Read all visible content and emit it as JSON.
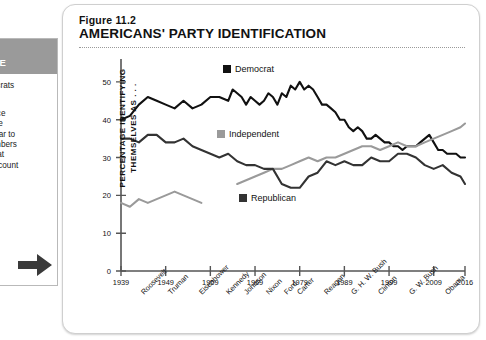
{
  "sidebar": {
    "header_lines": [
      "G",
      "NCE"
    ],
    "paragraphs": [
      "mocrats\nd",
      "Since\ns the\nppear to\nnumbers\nWhat\nt account\nsan\non?"
    ],
    "arrow_icon": "right-arrow-icon"
  },
  "figure": {
    "number": "Figure 11.2",
    "title": "AMERICANS' PARTY IDENTIFICATION"
  },
  "chart_data": {
    "type": "line",
    "title": "AMERICANS' PARTY IDENTIFICATION",
    "xlabel": "",
    "ylabel": "PERCENTAGE IDENTIFYING THEMSELVES AS . . .",
    "ylim": [
      0,
      55
    ],
    "yticks": [
      0,
      10,
      20,
      30,
      40,
      50
    ],
    "xlim": [
      1939,
      2016
    ],
    "xticks": [
      1939,
      1949,
      1959,
      1969,
      1979,
      1989,
      1999,
      2009,
      2016
    ],
    "xtick_labels": [
      "1939",
      "1949",
      "1959",
      "1969",
      "1979",
      "1989",
      "1999",
      "2009",
      "2016"
    ],
    "grid": false,
    "legend_position": "inline-annotations",
    "presidents": [
      "Roosevelt",
      "Truman",
      "Eisenhower",
      "Kennedy",
      "Johnson",
      "Nixon",
      "Ford",
      "Carter",
      "Reagan",
      "G. H. W. Bush",
      "Clinton",
      "G. W. Bush",
      "Obama"
    ],
    "president_positions": [
      1943,
      1949,
      1956,
      1962,
      1966,
      1971,
      1975,
      1978,
      1984,
      1990,
      1996,
      2003,
      2011
    ],
    "series": [
      {
        "name": "Democrat",
        "color": "#111111",
        "marker": "black-square",
        "x": [
          1939,
          1941,
          1943,
          1945,
          1947,
          1949,
          1951,
          1953,
          1955,
          1957,
          1959,
          1961,
          1963,
          1964,
          1965,
          1966,
          1967,
          1968,
          1969,
          1970,
          1971,
          1972,
          1973,
          1974,
          1975,
          1976,
          1977,
          1978,
          1979,
          1980,
          1981,
          1982,
          1983,
          1984,
          1985,
          1986,
          1987,
          1988,
          1989,
          1990,
          1991,
          1992,
          1993,
          1994,
          1995,
          1996,
          1997,
          1998,
          1999,
          2000,
          2001,
          2002,
          2003,
          2004,
          2005,
          2006,
          2007,
          2008,
          2009,
          2010,
          2011,
          2012,
          2013,
          2014,
          2015,
          2016
        ],
        "values": [
          40,
          41,
          44,
          46,
          45,
          44,
          43,
          45,
          43,
          44,
          46,
          46,
          45,
          48,
          47,
          46,
          44,
          46,
          45,
          44,
          45,
          47,
          46,
          44,
          47,
          46,
          49,
          48,
          50,
          48,
          49,
          48,
          46,
          44,
          44,
          43,
          42,
          40,
          40,
          38,
          37,
          38,
          37,
          35,
          35,
          36,
          35,
          34,
          34,
          33,
          33,
          32,
          33,
          33,
          33,
          34,
          35,
          36,
          34,
          32,
          32,
          31,
          31,
          31,
          30,
          30
        ]
      },
      {
        "name": "Independent",
        "color": "#9a9a9a",
        "marker": "gray-square",
        "x": [
          1939,
          1941,
          1943,
          1945,
          1947,
          1949,
          1951,
          1953,
          1955,
          1957,
          1965,
          1967,
          1969,
          1971,
          1973,
          1975,
          1977,
          1979,
          1981,
          1983,
          1985,
          1987,
          1989,
          1991,
          1993,
          1995,
          1997,
          1999,
          2001,
          2003,
          2005,
          2007,
          2009,
          2011,
          2013,
          2015,
          2016
        ],
        "values": [
          18,
          17,
          19,
          18,
          19,
          20,
          21,
          20,
          19,
          18,
          23,
          24,
          25,
          26,
          27,
          27,
          28,
          29,
          30,
          29,
          30,
          30,
          31,
          32,
          33,
          33,
          32,
          33,
          34,
          33,
          33,
          34,
          35,
          36,
          37,
          38,
          39
        ]
      },
      {
        "name": "Republican",
        "color": "#333333",
        "marker": "dark-square",
        "x": [
          1939,
          1941,
          1943,
          1945,
          1947,
          1949,
          1951,
          1953,
          1955,
          1957,
          1959,
          1961,
          1963,
          1965,
          1967,
          1969,
          1971,
          1973,
          1975,
          1977,
          1979,
          1981,
          1983,
          1985,
          1987,
          1989,
          1991,
          1993,
          1995,
          1997,
          1999,
          2001,
          2003,
          2005,
          2007,
          2009,
          2011,
          2013,
          2015,
          2016
        ],
        "values": [
          35,
          35,
          34,
          36,
          36,
          34,
          34,
          35,
          33,
          32,
          31,
          30,
          31,
          29,
          28,
          28,
          27,
          27,
          23,
          22,
          22,
          25,
          26,
          29,
          28,
          29,
          28,
          28,
          30,
          29,
          29,
          31,
          31,
          30,
          28,
          27,
          28,
          26,
          25,
          23
        ]
      }
    ]
  }
}
